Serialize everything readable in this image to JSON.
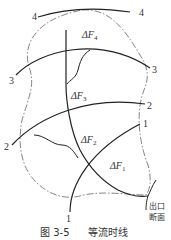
{
  "figure": {
    "caption_number": "图 3-5",
    "caption_title": "等流时线",
    "outlet_label_line1": "出口",
    "outlet_label_line2": "断面",
    "isochrone_labels": {
      "line1_left": "1",
      "line1_right": "1",
      "line2_left": "2",
      "line2_right": "2",
      "line3_left": "3",
      "line3_right": "3",
      "line4_left": "4",
      "line4_right": "4"
    },
    "area_labels": {
      "f1": {
        "prefix": "ΔF",
        "sub": "1"
      },
      "f2": {
        "prefix": "ΔF",
        "sub": "2"
      },
      "f3": {
        "prefix": "ΔF",
        "sub": "3"
      },
      "f4": {
        "prefix": "ΔF",
        "sub": "4"
      }
    },
    "colors": {
      "line": "#222222",
      "boundary": "#555555",
      "text": "#333333"
    }
  }
}
